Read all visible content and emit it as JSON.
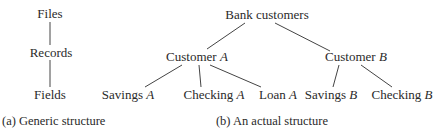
{
  "panel_a": {
    "nodes": {
      "files": "Files",
      "records": "Records",
      "fields": "Fields"
    },
    "caption": "(a) Generic structure"
  },
  "panel_b": {
    "root": "Bank customers",
    "customer_a": {
      "name": "Customer ",
      "letter": "A"
    },
    "customer_b": {
      "name": "Customer ",
      "letter": "B"
    },
    "leaves": [
      {
        "name": "Savings ",
        "letter": "A"
      },
      {
        "name": "Checking ",
        "letter": "A"
      },
      {
        "name": "Loan ",
        "letter": "A"
      },
      {
        "name": "Savings ",
        "letter": "B"
      },
      {
        "name": "Checking ",
        "letter": "B"
      }
    ],
    "caption": "(b) An actual structure"
  },
  "colors": {
    "text": "#2a2a2a",
    "edge": "#444444",
    "background": "#ffffff"
  }
}
